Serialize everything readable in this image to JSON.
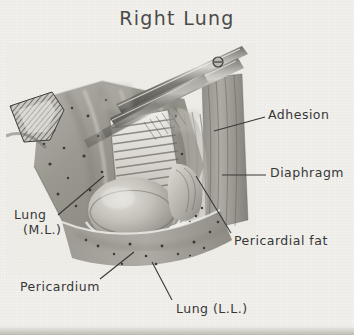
{
  "figure": {
    "title": "Right Lung",
    "domain_note": "grayscale surgical illustration of right lung with pleural adhesions",
    "background_color": "#f1f0ec",
    "ink_color": "#373737",
    "tissue_midtone": "#9a9a9a"
  },
  "labels": [
    {
      "id": "adhesion",
      "text": "Adhesion",
      "sub": ""
    },
    {
      "id": "diaphragm",
      "text": "Diaphragm",
      "sub": ""
    },
    {
      "id": "pericardial-fat",
      "text": "Pericardial fat",
      "sub": ""
    },
    {
      "id": "lung-ml",
      "text": "Lung",
      "sub": "(M.L.)"
    },
    {
      "id": "pericardium",
      "text": "Pericardium",
      "sub": ""
    },
    {
      "id": "lung-ll",
      "text": "Lung (L.L.)",
      "sub": ""
    }
  ],
  "structures": [
    {
      "name": "middle-lobe-lung-surface"
    },
    {
      "name": "lower-lobe-lung-surface"
    },
    {
      "name": "fibrous-adhesion-bands"
    },
    {
      "name": "pericardium-dome"
    },
    {
      "name": "pericardial-fat-pad"
    },
    {
      "name": "diaphragm-surface"
    },
    {
      "name": "surgical-scissors"
    },
    {
      "name": "retractor-tip"
    }
  ]
}
